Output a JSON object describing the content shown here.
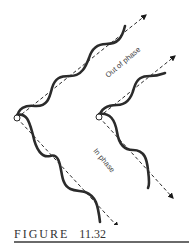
{
  "figure": {
    "label": "FIGURE",
    "number": "11.32"
  },
  "diagram": {
    "labels": {
      "out_of_phase": "Out of phase",
      "in_phase": "In phase"
    },
    "colors": {
      "wave": "#2b2b2b",
      "axis": "#2b2b2b",
      "caption_rule": "#6a6a6a"
    }
  }
}
